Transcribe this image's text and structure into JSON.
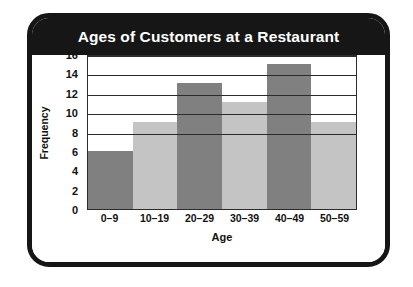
{
  "card": {
    "title": "Ages of Customers at a Restaurant",
    "border_color": "#161616",
    "title_bar_color": "#161616",
    "title_text_color": "#ffffff",
    "background_color": "#ffffff"
  },
  "chart_data": {
    "type": "bar",
    "title": "Ages of Customers at a Restaurant",
    "xlabel": "Age",
    "ylabel": "Frequency",
    "categories": [
      "0–9",
      "10–19",
      "20–29",
      "30–39",
      "40–49",
      "50–59"
    ],
    "values": [
      6,
      9,
      13,
      11,
      15,
      9
    ],
    "ylim": [
      0,
      16
    ],
    "ytick_step": 2,
    "yticks": [
      16,
      14,
      12,
      10,
      8,
      6,
      4,
      2,
      0
    ],
    "gridlines": [
      16,
      14,
      12,
      10,
      8
    ],
    "grid": true,
    "legend": null,
    "bar_colors": [
      "#808080",
      "#c4c4c4",
      "#808080",
      "#c4c4c4",
      "#808080",
      "#c4c4c4"
    ],
    "bar_gap": 0,
    "axis_color": "#2b2b2b"
  }
}
